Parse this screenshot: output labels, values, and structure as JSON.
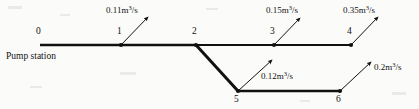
{
  "figure": {
    "type": "pipe-network-schematic",
    "width": 419,
    "height": 109,
    "background_color": "#fbfbfa",
    "line_color": "#111111"
  },
  "nodes": [
    {
      "id": "0",
      "label": "0",
      "x": 40,
      "y": 45,
      "label_x": 36,
      "label_y": 27,
      "marker": false
    },
    {
      "id": "1",
      "label": "1",
      "x": 121,
      "y": 45,
      "label_x": 117,
      "label_y": 27,
      "marker": true
    },
    {
      "id": "2",
      "label": "2",
      "x": 196,
      "y": 45,
      "label_x": 192,
      "label_y": 27,
      "marker": true
    },
    {
      "id": "3",
      "label": "3",
      "x": 274,
      "y": 45,
      "label_x": 270,
      "label_y": 27,
      "marker": true
    },
    {
      "id": "4",
      "label": "4",
      "x": 351,
      "y": 45,
      "label_x": 347,
      "label_y": 27,
      "marker": true
    },
    {
      "id": "5",
      "label": "5",
      "x": 238,
      "y": 91,
      "label_x": 234,
      "label_y": 95,
      "marker": true
    },
    {
      "id": "6",
      "label": "6",
      "x": 340,
      "y": 91,
      "label_x": 336,
      "label_y": 95,
      "marker": true
    }
  ],
  "pipes": [
    {
      "id": "0-1",
      "from": "0",
      "to": "1",
      "x1": 40,
      "y1": 45,
      "x2": 121,
      "y2": 45,
      "width": 2.6
    },
    {
      "id": "1-2",
      "from": "1",
      "to": "2",
      "x1": 121,
      "y1": 45,
      "x2": 196,
      "y2": 45,
      "width": 2.6
    },
    {
      "id": "2-3",
      "from": "2",
      "to": "3",
      "x1": 196,
      "y1": 45,
      "x2": 274,
      "y2": 45,
      "width": 2.0
    },
    {
      "id": "3-4",
      "from": "3",
      "to": "4",
      "x1": 274,
      "y1": 45,
      "x2": 351,
      "y2": 45,
      "width": 2.0
    },
    {
      "id": "2-5",
      "from": "2",
      "to": "5",
      "x1": 196,
      "y1": 45,
      "x2": 238,
      "y2": 91,
      "width": 3.0
    },
    {
      "id": "5-6",
      "from": "5",
      "to": "6",
      "x1": 238,
      "y1": 91,
      "x2": 340,
      "y2": 91,
      "width": 2.4
    }
  ],
  "demands": [
    {
      "id": "demand-node-1",
      "at_node": "1",
      "value": "0.11",
      "unit_base": "m",
      "unit_exp": "3",
      "unit_tail": "/s",
      "arrow": {
        "x1": 121,
        "y1": 45,
        "x2": 148,
        "y2": 17
      },
      "label_x": 106,
      "label_y": 6
    },
    {
      "id": "demand-node-3",
      "at_node": "3",
      "value": "0.15",
      "unit_base": "m",
      "unit_exp": "3",
      "unit_tail": "/s",
      "arrow": {
        "x1": 274,
        "y1": 45,
        "x2": 300,
        "y2": 18
      },
      "label_x": 266,
      "label_y": 6
    },
    {
      "id": "demand-node-4",
      "at_node": "4",
      "value": "0.35",
      "unit_base": "m",
      "unit_exp": "3",
      "unit_tail": "/s",
      "arrow": {
        "x1": 351,
        "y1": 45,
        "x2": 378,
        "y2": 17
      },
      "label_x": 343,
      "label_y": 6
    },
    {
      "id": "demand-node-5",
      "at_node": "5",
      "value": "0.12",
      "unit_base": "m",
      "unit_exp": "3",
      "unit_tail": "/s",
      "arrow": {
        "x1": 238,
        "y1": 91,
        "x2": 272,
        "y2": 60
      },
      "label_x": 261,
      "label_y": 72
    },
    {
      "id": "demand-node-6",
      "at_node": "6",
      "value": "0.2",
      "unit_base": "m",
      "unit_exp": "3",
      "unit_tail": "/s",
      "arrow": {
        "x1": 340,
        "y1": 91,
        "x2": 371,
        "y2": 62
      },
      "label_x": 374,
      "label_y": 63
    }
  ],
  "annotations": [
    {
      "id": "pump-station",
      "text": "Pump station",
      "x": 6,
      "y": 52
    }
  ]
}
